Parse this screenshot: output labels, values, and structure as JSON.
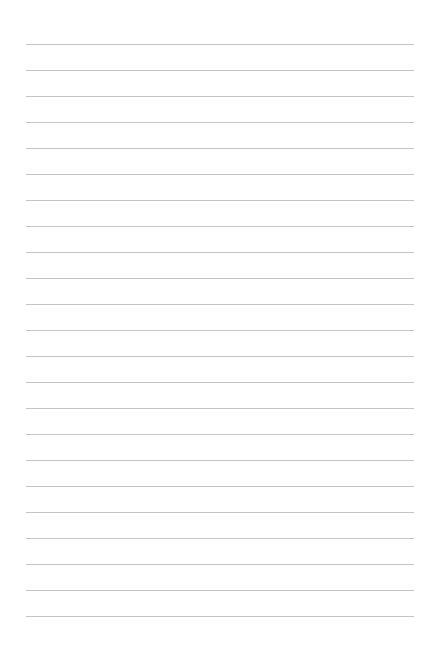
{
  "document": {
    "kind": "lined-paper",
    "title": "Lined Paper Sheet",
    "page_width": 424,
    "page_height": 662,
    "background_color": "#ffffff",
    "has_text_content": false,
    "visible_text": ""
  },
  "ruling": {
    "line_color": "#c4c4c4",
    "line_thickness": 1,
    "line_count": 23,
    "line_spacing": 26,
    "first_line_y": 44,
    "last_line_y": 616,
    "line_start_x": 26,
    "line_end_x": 414,
    "line_length": 388,
    "left_margin": 26,
    "right_margin": 10,
    "top_margin": 44,
    "bottom_margin": 46,
    "lines": [
      {
        "index": 1,
        "y": 44
      },
      {
        "index": 2,
        "y": 70
      },
      {
        "index": 3,
        "y": 96
      },
      {
        "index": 4,
        "y": 122
      },
      {
        "index": 5,
        "y": 148
      },
      {
        "index": 6,
        "y": 174
      },
      {
        "index": 7,
        "y": 200
      },
      {
        "index": 8,
        "y": 226
      },
      {
        "index": 9,
        "y": 252
      },
      {
        "index": 10,
        "y": 278
      },
      {
        "index": 11,
        "y": 304
      },
      {
        "index": 12,
        "y": 330
      },
      {
        "index": 13,
        "y": 356
      },
      {
        "index": 14,
        "y": 382
      },
      {
        "index": 15,
        "y": 408
      },
      {
        "index": 16,
        "y": 434
      },
      {
        "index": 17,
        "y": 460
      },
      {
        "index": 18,
        "y": 486
      },
      {
        "index": 19,
        "y": 512
      },
      {
        "index": 20,
        "y": 538
      },
      {
        "index": 21,
        "y": 564
      },
      {
        "index": 22,
        "y": 590
      },
      {
        "index": 23,
        "y": 616
      }
    ]
  }
}
